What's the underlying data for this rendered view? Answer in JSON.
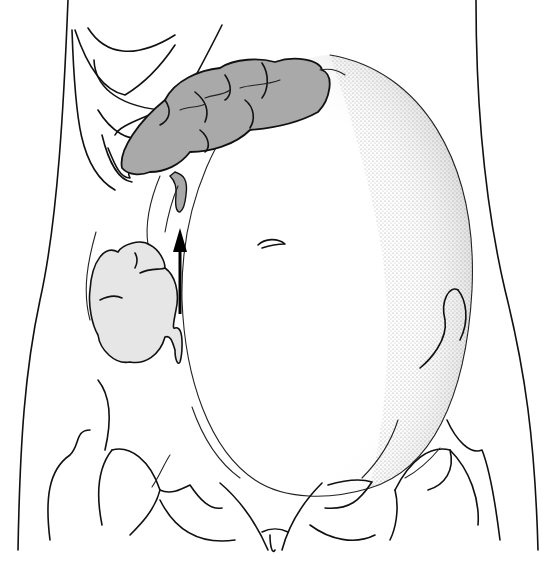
{
  "figure": {
    "labels": [],
    "elements": {
      "uterus": "uterus",
      "colon": "ascending-transverse-colon",
      "appendix_upper": "displaced-appendix",
      "cecum_lower": "normal-cecum-position",
      "arrow": "upward-displacement-arrow",
      "ribs": "rib-cage",
      "pelvis": "pelvis"
    },
    "colors": {
      "line": "#111111",
      "colon_fill": "#a9a9a9",
      "cecum_fill": "#e6e6e6",
      "background": "#ffffff"
    }
  }
}
